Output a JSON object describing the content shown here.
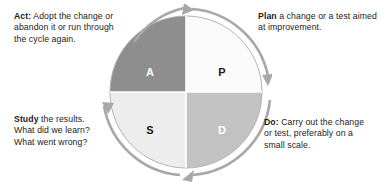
{
  "diagram": {
    "name": "PDSA cycle wheel",
    "cycle_direction": "clockwise",
    "wheel": {
      "quadrants": [
        {
          "key": "A",
          "label": "A",
          "position": "top-left",
          "fill": "#8e8e8e",
          "text_color": "#ffffff"
        },
        {
          "key": "P",
          "label": "P",
          "position": "top-right",
          "fill": "#fbfbfb",
          "text_color": "#1b1b1b"
        },
        {
          "key": "S",
          "label": "S",
          "position": "bottom-left",
          "fill": "#ededed",
          "text_color": "#1b1b1b"
        },
        {
          "key": "D",
          "label": "D",
          "position": "bottom-right",
          "fill": "#c2c2c2",
          "text_color": "#ffffff"
        }
      ],
      "arrow_color": "#a8a8a8",
      "divider_color": "#ffffff",
      "outline_color": "#b0b0b0"
    },
    "captions": {
      "act": {
        "lead": "Act:",
        "line1_rest": " Adopt the change or",
        "line2": "abandon it or run through",
        "line3": "the cycle again."
      },
      "plan": {
        "lead": "Plan",
        "line1_rest": " a change or a test aimed",
        "line2": "at improvement.",
        "line3": ""
      },
      "study": {
        "lead": "Study",
        "line1_rest": " the results.",
        "line2": "What did we learn?",
        "line3": "What went wrong?"
      },
      "do": {
        "lead": "Do:",
        "line1_rest": " Carry out the change",
        "line2": "or test, preferably on a",
        "line3": "small scale."
      }
    }
  }
}
